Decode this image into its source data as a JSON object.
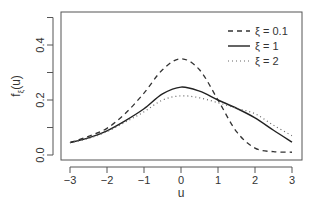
{
  "chart_data": {
    "type": "line",
    "title": "",
    "xlabel": "u",
    "ylabel": "f_ξ(u)",
    "ylabel_main": "f",
    "ylabel_sub": "ξ",
    "ylabel_tail": "(u)",
    "xlim": [
      -3,
      3
    ],
    "ylim": [
      0,
      0.5
    ],
    "x_ticks": [
      -3,
      -2,
      -1,
      0,
      1,
      2,
      3
    ],
    "x_tick_labels": [
      "−3",
      "−2",
      "−1",
      "0",
      "1",
      "2",
      "3"
    ],
    "y_ticks": [
      0.0,
      0.1,
      0.2,
      0.3,
      0.4,
      0.5
    ],
    "y_tick_labels": [
      "0.0",
      "",
      "0.2",
      "",
      "0.4",
      ""
    ],
    "grid": false,
    "legend_position": "top-right",
    "x": [
      -3,
      -2.5,
      -2,
      -1.5,
      -1,
      -0.5,
      0,
      0.5,
      1,
      1.5,
      2,
      2.5,
      3
    ],
    "series": [
      {
        "name": "ξ = 0.1",
        "style": "dashed",
        "values": [
          0.045,
          0.068,
          0.097,
          0.152,
          0.225,
          0.31,
          0.35,
          0.31,
          0.2,
          0.085,
          0.025,
          0.012,
          0.01
        ]
      },
      {
        "name": "ξ = 1",
        "style": "solid",
        "values": [
          0.045,
          0.062,
          0.088,
          0.125,
          0.168,
          0.222,
          0.247,
          0.232,
          0.2,
          0.17,
          0.135,
          0.09,
          0.047
        ]
      },
      {
        "name": "ξ = 2",
        "style": "dotted",
        "values": [
          0.045,
          0.06,
          0.085,
          0.12,
          0.157,
          0.2,
          0.215,
          0.208,
          0.19,
          0.17,
          0.15,
          0.108,
          0.07
        ]
      }
    ]
  },
  "legend": {
    "items": [
      "ξ = 0.1",
      "ξ = 1",
      "ξ = 2"
    ]
  }
}
